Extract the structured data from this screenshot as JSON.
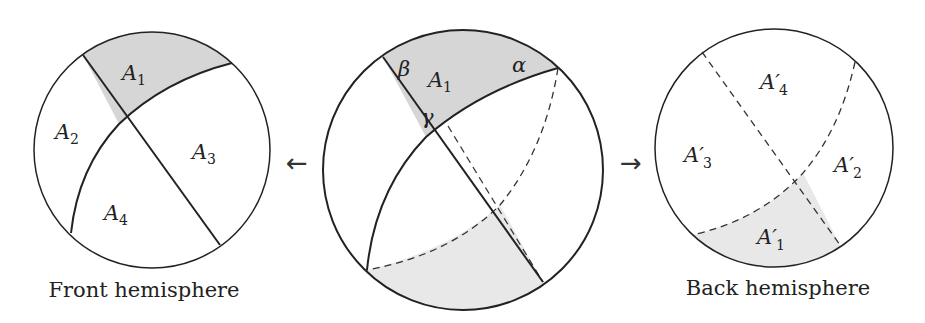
{
  "colors": {
    "stroke": "#222222",
    "shade_dark": "#d6d6d6",
    "shade_light": "#e8e8e8",
    "background": "#ffffff"
  },
  "left": {
    "caption": "Front hemisphere",
    "labels": {
      "a1": "A",
      "a1_sub": "1",
      "a2": "A",
      "a2_sub": "2",
      "a3": "A",
      "a3_sub": "3",
      "a4": "A",
      "a4_sub": "4"
    }
  },
  "arrows": {
    "left": "←",
    "right": "→"
  },
  "middle": {
    "labels": {
      "beta": "β",
      "alpha": "α",
      "gamma": "γ",
      "a1": "A",
      "a1_sub": "1"
    }
  },
  "right": {
    "caption": "Back hemisphere",
    "labels": {
      "a1": "A′",
      "a1_sub": "1",
      "a2": "A′",
      "a2_sub": "2",
      "a3": "A′",
      "a3_sub": "3",
      "a4": "A′",
      "a4_sub": "4"
    }
  }
}
